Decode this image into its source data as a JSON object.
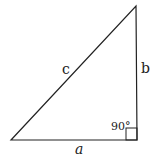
{
  "diagram": {
    "type": "right-triangle",
    "labels": {
      "hypotenuse": "c",
      "vertical_leg": "b",
      "horizontal_leg": "a",
      "angle": "90°"
    },
    "colors": {
      "stroke": "#222222",
      "background": "#ffffff"
    }
  }
}
